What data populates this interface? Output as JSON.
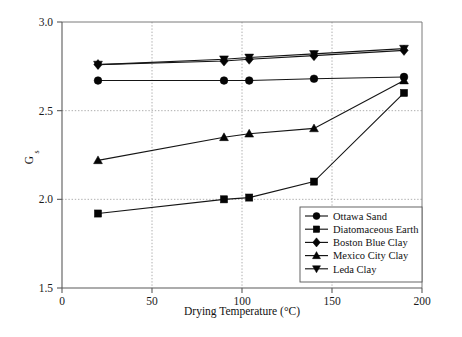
{
  "chart_data": {
    "type": "line",
    "title": "",
    "xlabel": "Drying Temperature (°C)",
    "ylabel": "G",
    "ylabel_sub": "s",
    "xlim": [
      0,
      200
    ],
    "ylim": [
      1.5,
      3.0
    ],
    "xticks": [
      0,
      50,
      100,
      150,
      200
    ],
    "xticklabels": [
      "0",
      "50",
      "100",
      "150",
      "200"
    ],
    "yticks": [
      1.5,
      2.0,
      2.5,
      3.0
    ],
    "yticklabels": [
      "1.5",
      "2.0",
      "2.5",
      "3.0"
    ],
    "grid": "dotted gridlines at x=50,100,150 and y=2.0,2.5",
    "legend_position": "lower right inside axes",
    "series": [
      {
        "name": "Ottawa Sand",
        "marker": "circle",
        "x": [
          20,
          90,
          104,
          140,
          190
        ],
        "values": [
          2.67,
          2.67,
          2.67,
          2.68,
          2.69
        ]
      },
      {
        "name": "Diatomaceous Earth",
        "marker": "square",
        "x": [
          20,
          90,
          104,
          140,
          190
        ],
        "values": [
          1.92,
          2.0,
          2.01,
          2.1,
          2.6
        ]
      },
      {
        "name": "Boston Blue Clay",
        "marker": "diamond",
        "x": [
          20,
          90,
          104,
          140,
          190
        ],
        "values": [
          2.76,
          2.78,
          2.79,
          2.81,
          2.84
        ]
      },
      {
        "name": "Mexico City Clay",
        "marker": "triangle-up",
        "x": [
          20,
          90,
          104,
          140,
          190
        ],
        "values": [
          2.22,
          2.35,
          2.37,
          2.4,
          2.67
        ]
      },
      {
        "name": "Leda Clay",
        "marker": "triangle-down",
        "x": [
          20,
          90,
          104,
          140,
          190
        ],
        "values": [
          2.76,
          2.79,
          2.8,
          2.82,
          2.85
        ]
      }
    ]
  }
}
